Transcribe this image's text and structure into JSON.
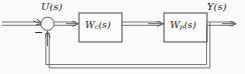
{
  "figure": {
    "background_color": "#fbfbfa",
    "line_color": "#555555",
    "text_color": "#1d1d1d",
    "width": 245,
    "height": 74
  },
  "signals": {
    "input": {
      "label_main": "U",
      "label_arg": "(s)",
      "full": "U(s)"
    },
    "output": {
      "label_main": "Y",
      "label_arg": "(s)",
      "full": "Y(s)"
    }
  },
  "summing_junction": {
    "name": "summing-junction",
    "shape": "circle",
    "negative_sign": "−",
    "positive_input": "U(s)",
    "negative_input": "feedback"
  },
  "blocks": [
    {
      "id": "controller",
      "label_main": "W",
      "label_sub": "c",
      "label_arg": "(s)",
      "full": "Wc(s)"
    },
    {
      "id": "plant",
      "label_main": "W",
      "label_sub": "p",
      "label_arg": "(s)",
      "full": "Wp(s)"
    }
  ],
  "feedback": {
    "name": "feedback-path",
    "description": "unity feedback from output to summing junction"
  }
}
